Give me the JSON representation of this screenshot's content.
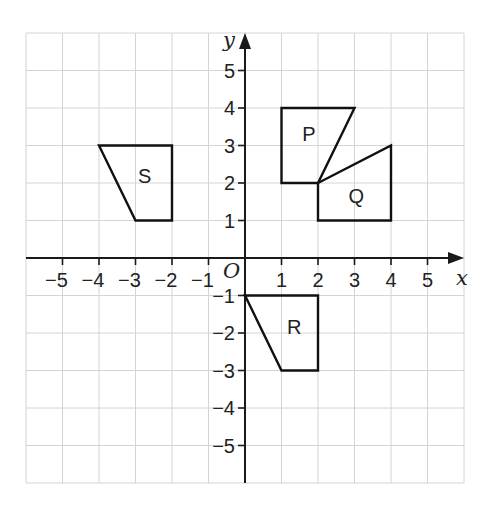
{
  "diagram": {
    "type": "coordinate-grid",
    "x_axis_label": "x",
    "y_axis_label": "y",
    "origin_label": "O",
    "x_range": [
      -6,
      6
    ],
    "y_range": [
      -6,
      6
    ],
    "x_ticks": [
      {
        "value": -5,
        "label": "−5"
      },
      {
        "value": -4,
        "label": "−4"
      },
      {
        "value": -3,
        "label": "−3"
      },
      {
        "value": -2,
        "label": "−2"
      },
      {
        "value": -1,
        "label": "−1"
      },
      {
        "value": 1,
        "label": "1"
      },
      {
        "value": 2,
        "label": "2"
      },
      {
        "value": 3,
        "label": "3"
      },
      {
        "value": 4,
        "label": "4"
      },
      {
        "value": 5,
        "label": "5"
      }
    ],
    "y_ticks": [
      {
        "value": 5,
        "label": "5"
      },
      {
        "value": 4,
        "label": "4"
      },
      {
        "value": 3,
        "label": "3"
      },
      {
        "value": 2,
        "label": "2"
      },
      {
        "value": 1,
        "label": "1"
      },
      {
        "value": -1,
        "label": "−1"
      },
      {
        "value": -2,
        "label": "−2"
      },
      {
        "value": -3,
        "label": "−3"
      },
      {
        "value": -4,
        "label": "−4"
      },
      {
        "value": -5,
        "label": "−5"
      }
    ],
    "shapes": [
      {
        "label": "P",
        "vertices": [
          [
            1,
            4
          ],
          [
            3,
            4
          ],
          [
            2,
            2
          ],
          [
            1,
            2
          ]
        ],
        "label_pos": [
          1.75,
          3.3
        ]
      },
      {
        "label": "Q",
        "vertices": [
          [
            2,
            2
          ],
          [
            4,
            3
          ],
          [
            4,
            1
          ],
          [
            2,
            1
          ]
        ],
        "label_pos": [
          3.05,
          1.65
        ]
      },
      {
        "label": "R",
        "vertices": [
          [
            0,
            -1
          ],
          [
            2,
            -1
          ],
          [
            2,
            -3
          ],
          [
            1,
            -3
          ]
        ],
        "label_pos": [
          1.35,
          -1.85
        ]
      },
      {
        "label": "S",
        "vertices": [
          [
            -4,
            3
          ],
          [
            -2,
            3
          ],
          [
            -2,
            1
          ],
          [
            -3,
            1
          ]
        ],
        "label_pos": [
          -2.75,
          2.2
        ]
      }
    ],
    "colors": {
      "grid": "#d4d4d4",
      "axis": "#1a1a1a",
      "shape_stroke": "#111111"
    }
  }
}
